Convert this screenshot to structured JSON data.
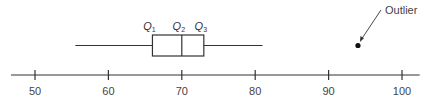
{
  "chart_data": {
    "type": "boxplot",
    "title": "",
    "xlabel": "",
    "ylabel": "",
    "xlim": [
      47,
      102
    ],
    "ticks": [
      50,
      60,
      70,
      80,
      90,
      100
    ],
    "tick_labels": [
      "50",
      "60",
      "70",
      "80",
      "90",
      "100"
    ],
    "grid": false,
    "box": {
      "min": 55.5,
      "q1": 66,
      "median": 70,
      "q3": 73,
      "max": 81
    },
    "outliers": [
      94
    ],
    "quartile_labels": [
      {
        "letter": "Q",
        "sub": "1"
      },
      {
        "letter": "Q",
        "sub": "2"
      },
      {
        "letter": "Q",
        "sub": "3"
      }
    ],
    "annotations": [
      {
        "text": "Outlier",
        "target": 94
      }
    ]
  }
}
